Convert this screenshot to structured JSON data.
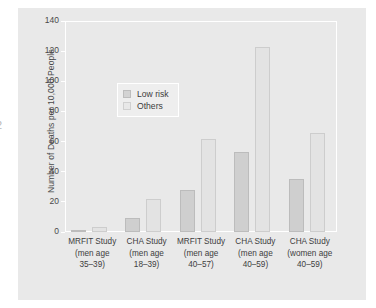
{
  "page_artifact": "2",
  "chart_data": {
    "type": "bar",
    "title": "",
    "xlabel": "",
    "ylabel": "Number of Deaths per 10,000 People",
    "ylim": [
      0,
      140
    ],
    "yticks": [
      0,
      20,
      40,
      60,
      80,
      100,
      120,
      140
    ],
    "grid": false,
    "legend_position": "upper left",
    "categories": [
      "MRFIT Study\n(men age\n35–39)",
      "CHA Study\n(men age\n18–39)",
      "MRFIT Study\n(men age\n40–57)",
      "CHA Study\n(men age\n40–59)",
      "CHA Study\n(women age\n40–59)"
    ],
    "category_lines": [
      [
        "MRFIT Study",
        "(men age",
        "35–39)"
      ],
      [
        "CHA Study",
        "(men age",
        "18–39)"
      ],
      [
        "MRFIT Study",
        "(men age",
        "40–57)"
      ],
      [
        "CHA Study",
        "(men age",
        "40–59)"
      ],
      [
        "CHA Study",
        "(women age",
        "40–59)"
      ]
    ],
    "series": [
      {
        "name": "Low risk",
        "color": "#cfcfcf",
        "values": [
          1,
          9,
          28,
          53,
          35
        ]
      },
      {
        "name": "Others",
        "color": "#e3e3e3",
        "values": [
          3,
          22,
          62,
          123,
          66
        ]
      }
    ]
  },
  "colors": {
    "page_background": "#ffffff",
    "panel_background": "#e9e9e9",
    "axis": "#ffffff",
    "text": "#404040",
    "low_risk": "#cfcfcf",
    "others": "#e3e3e3"
  }
}
